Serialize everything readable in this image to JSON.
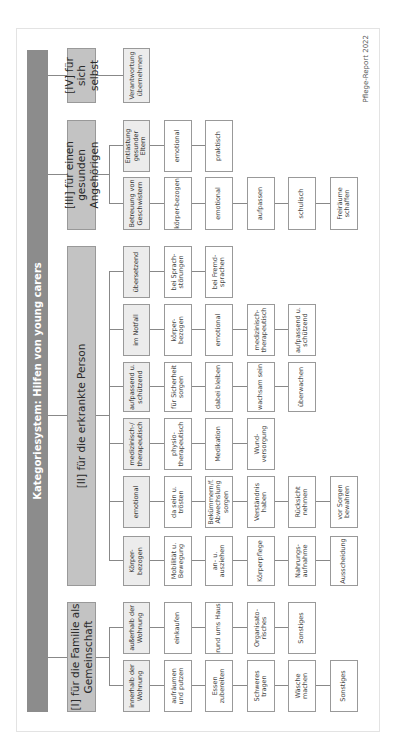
{
  "title": "Kategoriesystem: Hilfen von young carers",
  "footer": "Pflege-Report 2022",
  "categories": [
    {
      "label": "[I] für die Familie als Gemeinschaft",
      "groups": [
        {
          "label": "innerhalb der Wohnung",
          "items": [
            "aufräumen und putzen",
            "Essen zubereiten",
            "Schweres tragen",
            "Wäsche machen",
            "Sonstiges"
          ]
        },
        {
          "label": "außerhalb der Wohnung",
          "items": [
            "einkaufen",
            "rund ums Haus",
            "Organisato-risches",
            "Sonstiges"
          ]
        }
      ]
    },
    {
      "label": "[II] für die erkrankte Person",
      "groups": [
        {
          "label": "Körper-bezogen",
          "items": [
            "Mobilität u. Bewegung",
            "an- u. ausziehen",
            "Körperpflege",
            "Nahrungs-aufnahme",
            "Ausscheidung"
          ]
        },
        {
          "label": "emotional",
          "items": [
            "da sein u. trösten",
            "Bekümmern/f. Abwechslung sorgen",
            "Verständnis haben",
            "Rücksicht nehmen",
            "vor Sorgen bewahren"
          ]
        },
        {
          "label": "medizinisch-/ therapeutisch",
          "items": [
            "physio-therapeutisch",
            "Medikation",
            "Wund-versorgung"
          ]
        },
        {
          "label": "aufpassend u. schützend",
          "items": [
            "für Sicherheit sorgen",
            "dabei bleiben",
            "wachsam sein",
            "überwachen"
          ]
        },
        {
          "label": "im Notfall",
          "items": [
            "körper-bezogen",
            "emotional",
            "medizinisch-therapeutisch",
            "aufpassend u. schützend"
          ]
        },
        {
          "label": "übersetzend",
          "items": [
            "bei Sprach-störungen",
            "bei Fremd-sprachen"
          ]
        }
      ]
    },
    {
      "label": "[III] für einen gesunden Angehörigen",
      "groups": [
        {
          "label": "Betreuung von Geschwistern",
          "items": [
            "körper-bezogen",
            "emotional",
            "aufpassen",
            "schulisch",
            "Freiräume schaffen"
          ]
        },
        {
          "label": "Entlastung gesunder Eltern",
          "items": [
            "emotional",
            "praktisch"
          ]
        }
      ]
    },
    {
      "label": "[IV] für sich selbst",
      "groups": [
        {
          "label": "Verantwortung übernehmen",
          "items": []
        }
      ]
    }
  ]
}
